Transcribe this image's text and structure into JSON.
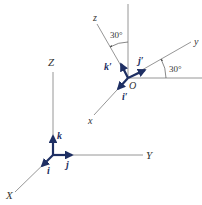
{
  "colors": {
    "axis": "#7f7f7f",
    "unit_vector": "#1e2f63",
    "text": "#333333",
    "background": "#ffffff"
  },
  "fixed_frame": {
    "axes": {
      "X": "X",
      "Y": "Y",
      "Z": "Z"
    },
    "unit_vectors": {
      "i": "i",
      "j": "j",
      "k": "k"
    }
  },
  "rotated_frame": {
    "origin_label": "O",
    "axes": {
      "x": "x",
      "y": "y",
      "z": "z"
    },
    "unit_vectors": {
      "i_prime": "i′",
      "j_prime": "j′",
      "k_prime": "k′"
    },
    "angles": {
      "z_from_vertical": "30°",
      "y_from_horizontal": "30°"
    }
  }
}
